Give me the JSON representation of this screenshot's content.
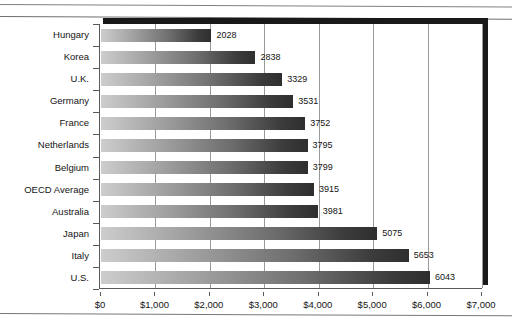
{
  "chart_data": {
    "type": "bar",
    "orientation": "horizontal",
    "title": "",
    "subtitle": "",
    "xlabel": "",
    "ylabel": "",
    "categories": [
      "Hungary",
      "Korea",
      "U.K.",
      "Germany",
      "France",
      "Netherlands",
      "Belgium",
      "OECD Average",
      "Australia",
      "Japan",
      "Italy",
      "U.S."
    ],
    "values": [
      2028,
      2838,
      3329,
      3531,
      3752,
      3795,
      3799,
      3915,
      3981,
      5075,
      5653,
      6043
    ],
    "data_labels": [
      "2028",
      "2838",
      "3329",
      "3531",
      "3752",
      "3795",
      "3799",
      "3915",
      "3981",
      "5075",
      "5653",
      "6043"
    ],
    "xlim": [
      0,
      7000
    ],
    "xticks": [
      0,
      1000,
      2000,
      3000,
      4000,
      5000,
      6000,
      7000
    ],
    "xtick_labels": [
      "$0",
      "$1,000",
      "$2,000",
      "$3,000",
      "$4,000",
      "$5,000",
      "$6,000",
      "$7,000"
    ],
    "grid": "vertical",
    "legend": "none",
    "bar_fill": "gradient-light-to-dark-gray",
    "colors": {
      "bar_start": "#cdcdcd",
      "bar_end": "#2e2e2e",
      "gridline": "#9a9a9a",
      "axis": "#5a5a5a",
      "bevel": "#191919",
      "text": "#141414",
      "background": "#ffffff"
    }
  }
}
